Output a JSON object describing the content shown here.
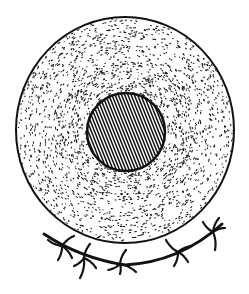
{
  "figure": {
    "parts": [
      "cell-membrane",
      "cytoplasm",
      "nucleus",
      "perinuclear-granules",
      "attached-filament",
      "filament-appendages"
    ],
    "colors": {
      "ink": "#111111",
      "background": "#ffffff"
    },
    "nucleus_hatch": "diagonal-lines",
    "cytoplasm_texture": "stipple",
    "granule_count": 11,
    "appendage_count": 5
  }
}
